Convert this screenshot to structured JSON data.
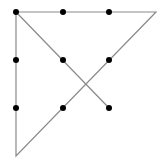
{
  "diagram": {
    "type": "nine-dot-puzzle-solution",
    "line_color": "#8a8a8a",
    "dot_color": "#000000",
    "dot_radius": 3,
    "dots": [
      {
        "row": 0,
        "col": 0,
        "x": 16,
        "y": 12
      },
      {
        "row": 0,
        "col": 1,
        "x": 63,
        "y": 12
      },
      {
        "row": 0,
        "col": 2,
        "x": 109,
        "y": 12
      },
      {
        "row": 1,
        "col": 0,
        "x": 16,
        "y": 60
      },
      {
        "row": 1,
        "col": 1,
        "x": 63,
        "y": 60
      },
      {
        "row": 1,
        "col": 2,
        "x": 109,
        "y": 60
      },
      {
        "row": 2,
        "col": 0,
        "x": 16,
        "y": 108
      },
      {
        "row": 2,
        "col": 1,
        "x": 63,
        "y": 108
      },
      {
        "row": 2,
        "col": 2,
        "x": 109,
        "y": 108
      }
    ],
    "path": [
      {
        "x": 109,
        "y": 108
      },
      {
        "x": 16,
        "y": 12
      },
      {
        "x": 156,
        "y": 12
      },
      {
        "x": 16,
        "y": 156
      },
      {
        "x": 16,
        "y": 12
      }
    ]
  }
}
